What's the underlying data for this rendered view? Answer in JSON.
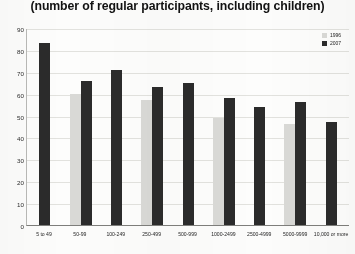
{
  "chart_data": {
    "type": "bar",
    "title": "(number of regular participants, including children)",
    "xlabel": "",
    "ylabel": "",
    "ylim": [
      0,
      90
    ],
    "yticks": [
      0,
      10,
      20,
      30,
      40,
      50,
      60,
      70,
      80,
      90
    ],
    "grid": true,
    "legend_position": "top-right",
    "categories": [
      "5 to 49",
      "50-99",
      "100-249",
      "250-499",
      "500-999",
      "1000-2499",
      "2500-4999",
      "5000-9999",
      "10,000 or more"
    ],
    "series": [
      {
        "name": "1996",
        "color": "#d9d9d6",
        "values": [
          0,
          60,
          0,
          57,
          0,
          49,
          0,
          46,
          0
        ]
      },
      {
        "name": "2007",
        "color": "#2b2b2b",
        "values": [
          83,
          66,
          71,
          63,
          65,
          58,
          54,
          56,
          47
        ]
      }
    ]
  },
  "legend": {
    "items": [
      {
        "label": "1996",
        "color": "#d9d9d6"
      },
      {
        "label": "2007",
        "color": "#2b2b2b"
      }
    ]
  }
}
